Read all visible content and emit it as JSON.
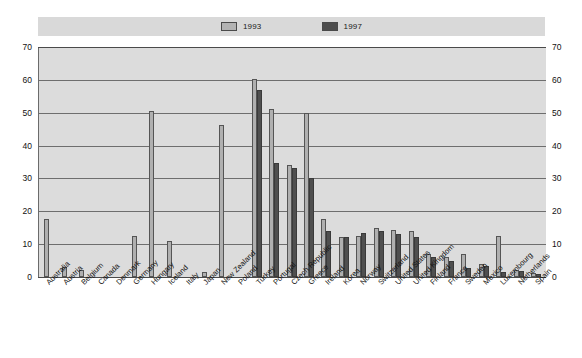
{
  "legend": {
    "entries": [
      {
        "label": "1993",
        "color": "#b0b0b0"
      },
      {
        "label": "1997",
        "color": "#4f4f4f"
      }
    ]
  },
  "axis": {
    "y_ticks": [
      "0",
      "10",
      "20",
      "30",
      "40",
      "50",
      "60",
      "70"
    ],
    "y_min": 0,
    "y_max": 70,
    "y_step": 10
  },
  "chart_data": {
    "type": "bar",
    "title": "",
    "subtitle": "",
    "xlabel": "",
    "ylabel": "",
    "ylim": [
      0,
      70
    ],
    "ystep": 10,
    "grid": true,
    "legend_position": "top",
    "categories": [
      "Australia",
      "Austria",
      "Belgium",
      "Canada",
      "Denmark",
      "Germany",
      "Hungary",
      "Iceland",
      "Italy",
      "Japan",
      "New Zealand",
      "Poland",
      "Turkey",
      "Portugal",
      "Czech Republic",
      "Greece",
      "Ireland",
      "Korea",
      "Norway",
      "Switzerland",
      "United States",
      "United Kingdom",
      "Finland",
      "France",
      "Sweden",
      "Mexico",
      "Luxembourg",
      "Netherlands",
      "Spain"
    ],
    "series": [
      {
        "name": "1993",
        "color": "#b0b0b0",
        "values": [
          17.7,
          3.0,
          2.2,
          0,
          0,
          12.5,
          50.5,
          11.0,
          0,
          1.5,
          46.3,
          0,
          60.2,
          51.0,
          34.0,
          50.0,
          17.8,
          12.3,
          12.5,
          15.0,
          14.2,
          14.0,
          7.0,
          6.2,
          7.0,
          4.0,
          12.4,
          2.2,
          1.3
        ]
      },
      {
        "name": "1997",
        "color": "#4f4f4f",
        "values": [
          0,
          0,
          0,
          0,
          0,
          0,
          0,
          0,
          0,
          0,
          0,
          0,
          56.8,
          34.6,
          33.2,
          30.2,
          14.0,
          12.3,
          13.5,
          14.0,
          13.0,
          12.3,
          6.0,
          5.0,
          2.6,
          3.3,
          1.6,
          1.8,
          1.0
        ]
      }
    ]
  }
}
